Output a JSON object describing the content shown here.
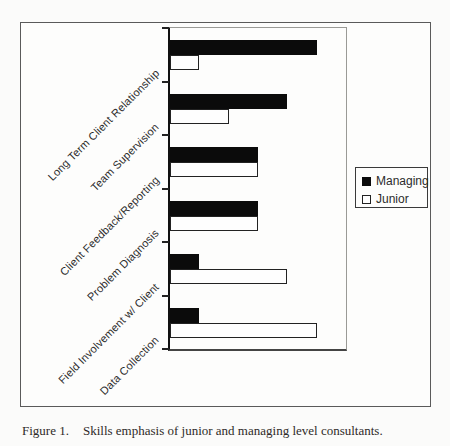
{
  "figure": {
    "caption_label": "Figure 1.",
    "caption_text": "Skills emphasis of junior and managing level consultants."
  },
  "chart_data": {
    "type": "bar",
    "orientation": "horizontal",
    "title": "",
    "xlabel": "",
    "ylabel": "",
    "categories": [
      "Long Term Client Relationship",
      "Team Supervision",
      "Client Feedback/Reporting",
      "Problem Diagnosis",
      "Field Involvement w/ Client",
      "Data Collection"
    ],
    "series": [
      {
        "name": "Managing",
        "color": "#0b0b0b",
        "fill": "solid-black",
        "values": [
          5,
          4,
          3,
          3,
          1,
          1
        ]
      },
      {
        "name": "Junior",
        "color": "#ffffff",
        "fill": "open-white",
        "values": [
          1,
          2,
          3,
          3,
          4,
          5
        ]
      }
    ],
    "xlim": [
      0,
      6
    ],
    "x_ticks_labeled": false,
    "grid": false,
    "legend_position": "right"
  },
  "colors": {
    "background": "#fbfbfa",
    "figure_border": "#5a5a5a",
    "axis": "#111111",
    "bar_managing": "#0b0b0b",
    "bar_junior": "#ffffff",
    "text": "#2b2b2b"
  }
}
